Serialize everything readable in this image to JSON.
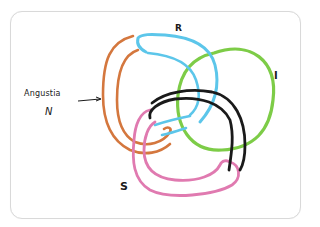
{
  "diagram": {
    "type": "hand-drawn Borromean-style knot / link diagram",
    "labels": {
      "angustia": "Angustia",
      "n": "N",
      "r": "R",
      "i": "I",
      "s": "S"
    },
    "components": [
      {
        "name": "orange-loop",
        "label": "N",
        "color": "#d4773e"
      },
      {
        "name": "blue-loop",
        "label": "R",
        "color": "#5cc6ea"
      },
      {
        "name": "green-circle",
        "label": "I",
        "color": "#7dcc47"
      },
      {
        "name": "pink-loop",
        "label": "S",
        "color": "#e07ab0"
      },
      {
        "name": "black-loop",
        "label": "",
        "color": "#1a1a1a"
      }
    ],
    "annotation": "Arrow from 'Angustia N' pointing to the orange loop"
  }
}
